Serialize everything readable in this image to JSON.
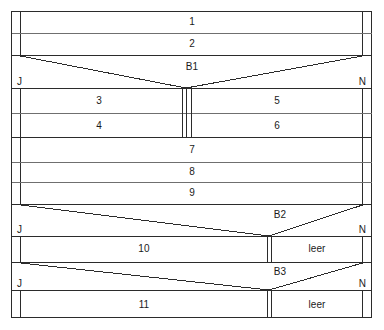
{
  "diagram": {
    "type": "layered-band-schematic",
    "colors": {
      "stroke": "#2b2b2b",
      "stroke_light": "#6f6f6f",
      "background": "#ffffff",
      "text": "#1a1a1a"
    },
    "geometry": {
      "outer_left": 11,
      "outer_right": 372,
      "inner_left": 20,
      "inner_right": 363,
      "outer_top": 11,
      "outer_bottom": 318,
      "center_split_x": 186,
      "center_split_left": 182,
      "center_split_right": 191,
      "lower_split_x": 269,
      "lower_split_left": 267,
      "lower_split_right": 272,
      "row_lines_y": [
        11,
        33,
        55,
        88,
        113,
        137,
        162,
        182,
        204,
        236,
        262,
        290,
        318
      ]
    },
    "bands": [
      {
        "id": "band-1",
        "label": "1",
        "y_top": 11,
        "y_bottom": 33,
        "kind": "full"
      },
      {
        "id": "band-2",
        "label": "2",
        "y_top": 33,
        "y_bottom": 55,
        "kind": "full"
      },
      {
        "id": "band-b1",
        "label": "B1",
        "y_top": 55,
        "y_bottom": 88,
        "kind": "taper-v",
        "edge_left": "J",
        "edge_right": "N"
      },
      {
        "id": "band-3-5",
        "label_left": "3",
        "label_right": "5",
        "y_top": 88,
        "y_bottom": 113,
        "kind": "split"
      },
      {
        "id": "band-4-6",
        "label_left": "4",
        "label_right": "6",
        "y_top": 113,
        "y_bottom": 137,
        "kind": "split"
      },
      {
        "id": "band-7",
        "label": "7",
        "y_top": 137,
        "y_bottom": 162,
        "kind": "full"
      },
      {
        "id": "band-8",
        "label": "8",
        "y_top": 162,
        "y_bottom": 182,
        "kind": "full"
      },
      {
        "id": "band-9",
        "label": "9",
        "y_top": 182,
        "y_bottom": 204,
        "kind": "full"
      },
      {
        "id": "band-b2",
        "label": "B2",
        "y_top": 204,
        "y_bottom": 236,
        "kind": "taper-v",
        "edge_left": "J",
        "edge_right": "N"
      },
      {
        "id": "band-10",
        "label_left": "10",
        "label_right": "leer",
        "y_top": 236,
        "y_bottom": 262,
        "kind": "split-lower"
      },
      {
        "id": "band-b3",
        "label": "B3",
        "y_top": 262,
        "y_bottom": 290,
        "kind": "taper-v",
        "edge_left": "J",
        "edge_right": "N"
      },
      {
        "id": "band-11",
        "label_left": "11",
        "label_right": "leer",
        "y_top": 290,
        "y_bottom": 318,
        "kind": "split-lower"
      }
    ],
    "labels": {
      "b1": "B1",
      "b2": "B2",
      "b3": "B3",
      "n1": "1",
      "n2": "2",
      "n3": "3",
      "n4": "4",
      "n5": "5",
      "n6": "6",
      "n7": "7",
      "n8": "8",
      "n9": "9",
      "n10": "10",
      "n11": "11",
      "leer_upper": "leer",
      "leer_lower": "leer",
      "j1": "J",
      "j2": "J",
      "j3": "J",
      "n_edge1": "N",
      "n_edge2": "N",
      "n_edge3": "N"
    }
  }
}
